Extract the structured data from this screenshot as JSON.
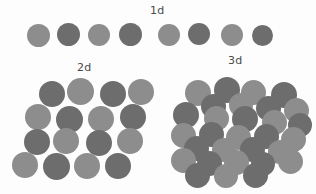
{
  "figure": {
    "title_visible": false,
    "background_color": "#fdfdfd",
    "width": 316,
    "height": 194,
    "description_kind": "particle-packing-dimensionality-diagram"
  },
  "palette": {
    "light_gray": "#8d8d8d",
    "dark_gray": "#6d6d6d",
    "mid_gray": "#7d7d7d",
    "label_color": "#4a4a4a",
    "background": "#fdfdfd"
  },
  "labels": {
    "one_d": "1d",
    "two_d": "2d",
    "three_d": "3d"
  },
  "label_positions": {
    "one_d": {
      "x": 150,
      "y": 4
    },
    "two_d": {
      "x": 77,
      "y": 61
    },
    "three_d": {
      "x": 228,
      "y": 54
    }
  },
  "groups": {
    "one_d": {
      "label": "1d",
      "count": 8,
      "particles": [
        {
          "cx": 38,
          "cy": 35,
          "r": 11.5,
          "color": "#8d8d8d"
        },
        {
          "cx": 68,
          "cy": 34,
          "r": 11.5,
          "color": "#6d6d6d"
        },
        {
          "cx": 99,
          "cy": 35,
          "r": 11.0,
          "color": "#8d8d8d"
        },
        {
          "cx": 130,
          "cy": 34,
          "r": 11.5,
          "color": "#6d6d6d"
        },
        {
          "cx": 169,
          "cy": 35,
          "r": 11.0,
          "color": "#8d8d8d"
        },
        {
          "cx": 199,
          "cy": 34,
          "r": 11.0,
          "color": "#6d6d6d"
        },
        {
          "cx": 232,
          "cy": 35,
          "r": 11.0,
          "color": "#8d8d8d"
        },
        {
          "cx": 262,
          "cy": 35,
          "r": 10.5,
          "color": "#6d6d6d"
        }
      ]
    },
    "two_d": {
      "label": "2d",
      "count": 16,
      "particles": [
        {
          "cx": 52,
          "cy": 94,
          "r": 13.0,
          "color": "#6d6d6d"
        },
        {
          "cx": 80,
          "cy": 91,
          "r": 13.5,
          "color": "#8d8d8d"
        },
        {
          "cx": 113,
          "cy": 94,
          "r": 13.0,
          "color": "#6d6d6d"
        },
        {
          "cx": 141,
          "cy": 92,
          "r": 13.0,
          "color": "#8d8d8d"
        },
        {
          "cx": 38,
          "cy": 117,
          "r": 13.0,
          "color": "#8d8d8d"
        },
        {
          "cx": 69,
          "cy": 119,
          "r": 13.5,
          "color": "#6d6d6d"
        },
        {
          "cx": 101,
          "cy": 119,
          "r": 13.0,
          "color": "#8d8d8d"
        },
        {
          "cx": 133,
          "cy": 117,
          "r": 13.0,
          "color": "#6d6d6d"
        },
        {
          "cx": 37,
          "cy": 142,
          "r": 13.0,
          "color": "#6d6d6d"
        },
        {
          "cx": 66,
          "cy": 141,
          "r": 13.0,
          "color": "#8d8d8d"
        },
        {
          "cx": 99,
          "cy": 143,
          "r": 13.0,
          "color": "#6d6d6d"
        },
        {
          "cx": 130,
          "cy": 141,
          "r": 13.0,
          "color": "#8d8d8d"
        },
        {
          "cx": 25,
          "cy": 165,
          "r": 13.0,
          "color": "#8d8d8d"
        },
        {
          "cx": 56,
          "cy": 166,
          "r": 13.5,
          "color": "#6d6d6d"
        },
        {
          "cx": 87,
          "cy": 166,
          "r": 13.0,
          "color": "#8d8d8d"
        },
        {
          "cx": 118,
          "cy": 166,
          "r": 13.0,
          "color": "#6d6d6d"
        }
      ]
    },
    "three_d": {
      "label": "3d",
      "count": 30,
      "particles": [
        {
          "cx": 198,
          "cy": 93,
          "r": 13.0,
          "color": "#8d8d8d"
        },
        {
          "cx": 227,
          "cy": 90,
          "r": 13.0,
          "color": "#6d6d6d"
        },
        {
          "cx": 253,
          "cy": 92,
          "r": 12.5,
          "color": "#8d8d8d"
        },
        {
          "cx": 284,
          "cy": 95,
          "r": 13.0,
          "color": "#6d6d6d"
        },
        {
          "cx": 213,
          "cy": 106,
          "r": 12.5,
          "color": "#6d6d6d"
        },
        {
          "cx": 241,
          "cy": 105,
          "r": 12.0,
          "color": "#8d8d8d"
        },
        {
          "cx": 268,
          "cy": 108,
          "r": 12.5,
          "color": "#6d6d6d"
        },
        {
          "cx": 296,
          "cy": 110,
          "r": 12.5,
          "color": "#8d8d8d"
        },
        {
          "cx": 186,
          "cy": 115,
          "r": 13.0,
          "color": "#6d6d6d"
        },
        {
          "cx": 216,
          "cy": 118,
          "r": 12.5,
          "color": "#8d8d8d"
        },
        {
          "cx": 245,
          "cy": 119,
          "r": 13.0,
          "color": "#6d6d6d"
        },
        {
          "cx": 274,
          "cy": 122,
          "r": 12.5,
          "color": "#8d8d8d"
        },
        {
          "cx": 300,
          "cy": 125,
          "r": 12.0,
          "color": "#6d6d6d"
        },
        {
          "cx": 183,
          "cy": 135,
          "r": 12.5,
          "color": "#8d8d8d"
        },
        {
          "cx": 211,
          "cy": 134,
          "r": 12.5,
          "color": "#6d6d6d"
        },
        {
          "cx": 238,
          "cy": 137,
          "r": 12.5,
          "color": "#8d8d8d"
        },
        {
          "cx": 266,
          "cy": 136,
          "r": 12.5,
          "color": "#6d6d6d"
        },
        {
          "cx": 293,
          "cy": 139,
          "r": 12.5,
          "color": "#8d8d8d"
        },
        {
          "cx": 196,
          "cy": 148,
          "r": 12.5,
          "color": "#6d6d6d"
        },
        {
          "cx": 224,
          "cy": 150,
          "r": 12.0,
          "color": "#8d8d8d"
        },
        {
          "cx": 252,
          "cy": 149,
          "r": 12.5,
          "color": "#6d6d6d"
        },
        {
          "cx": 280,
          "cy": 152,
          "r": 12.0,
          "color": "#8d8d8d"
        },
        {
          "cx": 183,
          "cy": 160,
          "r": 12.5,
          "color": "#8d8d8d"
        },
        {
          "cx": 209,
          "cy": 163,
          "r": 12.5,
          "color": "#6d6d6d"
        },
        {
          "cx": 236,
          "cy": 162,
          "r": 12.5,
          "color": "#8d8d8d"
        },
        {
          "cx": 263,
          "cy": 164,
          "r": 12.0,
          "color": "#6d6d6d"
        },
        {
          "cx": 290,
          "cy": 161,
          "r": 12.5,
          "color": "#8d8d8d"
        },
        {
          "cx": 197,
          "cy": 175,
          "r": 12.5,
          "color": "#6d6d6d"
        },
        {
          "cx": 226,
          "cy": 176,
          "r": 12.0,
          "color": "#8d8d8d"
        },
        {
          "cx": 255,
          "cy": 175,
          "r": 12.5,
          "color": "#6d6d6d"
        }
      ]
    }
  }
}
